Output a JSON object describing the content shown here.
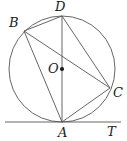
{
  "figure": {
    "kind": "circle-geometry-diagram",
    "width": 127,
    "height": 141,
    "background_color": "#ffffff",
    "stroke_color": "#555555",
    "label_color": "#1a1a1a",
    "stroke_width": 0.9
  },
  "circle": {
    "name": "circumscribed-circle",
    "center_x": 62,
    "center_y": 69,
    "radius": 53
  },
  "center_dot": {
    "x": 62,
    "y": 69,
    "radius": 2.1
  },
  "points": {
    "A": {
      "label": "A",
      "x": 62,
      "y": 122,
      "label_x": 58,
      "label_y": 126
    },
    "B": {
      "label": "B",
      "x": 24,
      "y": 31,
      "label_x": 9,
      "label_y": 16
    },
    "C": {
      "label": "C",
      "x": 110,
      "y": 88,
      "label_x": 113,
      "label_y": 86
    },
    "D": {
      "label": "D",
      "x": 62,
      "y": 16,
      "label_x": 55,
      "label_y": 0
    },
    "O": {
      "label": "O",
      "x": 62,
      "y": 69,
      "label_x": 48,
      "label_y": 62
    },
    "T": {
      "label": "T",
      "x": 120,
      "y": 122,
      "label_x": 107,
      "label_y": 125
    }
  },
  "chords": [
    {
      "name": "chord-BD",
      "from": "B",
      "to": "D",
      "x1": 24,
      "y1": 31,
      "x2": 62,
      "y2": 16
    },
    {
      "name": "chord-BA",
      "from": "B",
      "to": "A",
      "x1": 24,
      "y1": 31,
      "x2": 62,
      "y2": 122
    },
    {
      "name": "chord-BC",
      "from": "B",
      "to": "C",
      "x1": 24,
      "y1": 31,
      "x2": 110,
      "y2": 88
    },
    {
      "name": "chord-DA",
      "from": "D",
      "to": "A",
      "x1": 62,
      "y1": 16,
      "x2": 62,
      "y2": 122
    },
    {
      "name": "chord-DC",
      "from": "D",
      "to": "C",
      "x1": 62,
      "y1": 16,
      "x2": 110,
      "y2": 88
    },
    {
      "name": "chord-AC",
      "from": "A",
      "to": "C",
      "x1": 62,
      "y1": 122,
      "x2": 110,
      "y2": 88
    }
  ],
  "tangent_line": {
    "name": "tangent-at-A",
    "x1": 5,
    "y1": 122,
    "x2": 121,
    "y2": 122
  }
}
